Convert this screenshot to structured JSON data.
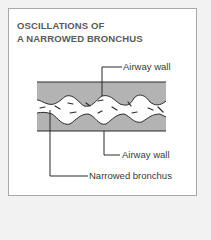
{
  "title": {
    "line1": "OSCILLATIONS OF",
    "line2": "A NARROWED BRONCHUS"
  },
  "labels": {
    "airway_wall_top": "Airway wall",
    "airway_wall_bottom": "Airway wall",
    "narrowed_bronchus": "Narrowed bronchus"
  },
  "colors": {
    "wall_fill": "#b3b3b3",
    "line": "#2b2b2b",
    "title": "#5a5a5a",
    "panel_border": "#a8a8a8",
    "background": "#f2f2f2"
  }
}
